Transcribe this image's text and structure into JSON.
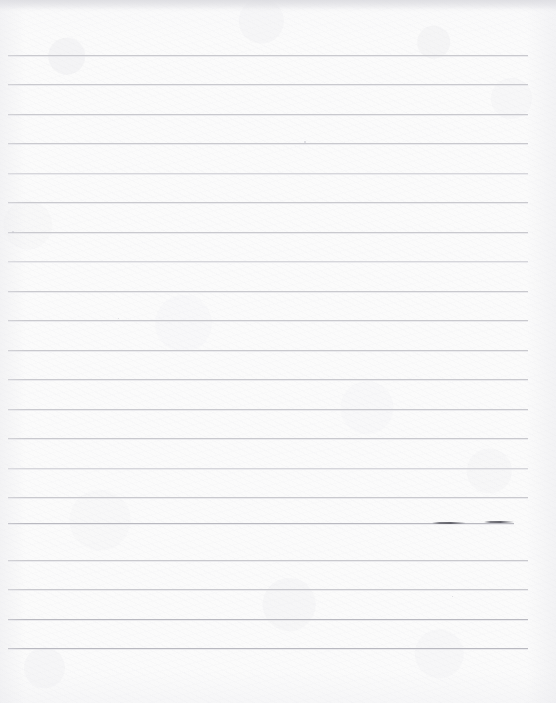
{
  "document": {
    "kind": "scanned-ruled-paper",
    "title": "Blank ruled notebook page",
    "content_text": "",
    "page_width": 556,
    "page_height": 703,
    "paper_color": "#fbfbfb",
    "rule_color": "#c9c9ce",
    "rule_faint_color": "#d6d6db",
    "rule_dark_color": "#b9b9c0",
    "smudge_color": "#5c5c64",
    "edge_shadow_color": "#d6d6db"
  },
  "ruling": {
    "line_count": 21,
    "spacing_px": 29.6,
    "first_line_y": 55,
    "last_line_y": 648,
    "line_left_x": 8,
    "line_right_x": 528,
    "top_margin_px": 55,
    "bottom_margin_px": 55,
    "lines": [
      {
        "y": 55,
        "x1": 8,
        "x2": 528,
        "weight": "normal"
      },
      {
        "y": 84,
        "x1": 8,
        "x2": 528,
        "weight": "normal"
      },
      {
        "y": 114,
        "x1": 8,
        "x2": 528,
        "weight": "normal"
      },
      {
        "y": 143,
        "x1": 8,
        "x2": 528,
        "weight": "normal"
      },
      {
        "y": 173,
        "x1": 8,
        "x2": 528,
        "weight": "faint"
      },
      {
        "y": 202,
        "x1": 8,
        "x2": 528,
        "weight": "normal"
      },
      {
        "y": 232,
        "x1": 8,
        "x2": 528,
        "weight": "normal"
      },
      {
        "y": 261,
        "x1": 8,
        "x2": 528,
        "weight": "faint"
      },
      {
        "y": 291,
        "x1": 8,
        "x2": 528,
        "weight": "normal"
      },
      {
        "y": 320,
        "x1": 8,
        "x2": 528,
        "weight": "normal"
      },
      {
        "y": 350,
        "x1": 8,
        "x2": 528,
        "weight": "normal"
      },
      {
        "y": 379,
        "x1": 8,
        "x2": 528,
        "weight": "normal"
      },
      {
        "y": 409,
        "x1": 8,
        "x2": 528,
        "weight": "normal"
      },
      {
        "y": 438,
        "x1": 8,
        "x2": 528,
        "weight": "normal"
      },
      {
        "y": 468,
        "x1": 8,
        "x2": 528,
        "weight": "faint"
      },
      {
        "y": 497,
        "x1": 8,
        "x2": 528,
        "weight": "normal"
      },
      {
        "y": 523,
        "x1": 8,
        "x2": 514,
        "weight": "dark"
      },
      {
        "y": 560,
        "x1": 8,
        "x2": 528,
        "weight": "normal"
      },
      {
        "y": 589,
        "x1": 8,
        "x2": 528,
        "weight": "normal"
      },
      {
        "y": 619,
        "x1": 8,
        "x2": 528,
        "weight": "dark"
      },
      {
        "y": 648,
        "x1": 8,
        "x2": 528,
        "weight": "dark"
      }
    ]
  },
  "marks": {
    "smudges": [
      {
        "x": 432,
        "y": 522,
        "width": 34
      },
      {
        "x": 484,
        "y": 521,
        "width": 30
      }
    ],
    "flecks": [
      {
        "x": 12,
        "y": 231,
        "size": 2
      },
      {
        "x": 304,
        "y": 141,
        "size": 2
      },
      {
        "x": 118,
        "y": 318,
        "size": 1
      },
      {
        "x": 452,
        "y": 596,
        "size": 1
      }
    ]
  }
}
